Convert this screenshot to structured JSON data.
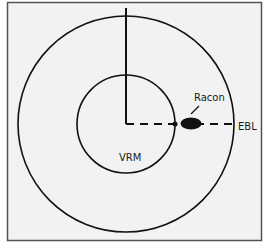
{
  "diagram": {
    "labels": {
      "racon": "Racon",
      "vrm": "VRM",
      "ebl": "EBL"
    },
    "colors": {
      "background": "#f2f2f2",
      "frame": "#555555",
      "ink": "#111111"
    },
    "elements": [
      {
        "id": "outer-range-ring",
        "type": "circle"
      },
      {
        "id": "vrm-ring",
        "type": "circle",
        "label": "VRM"
      },
      {
        "id": "heading-line",
        "type": "line"
      },
      {
        "id": "ebl-line",
        "type": "dashed-line",
        "label": "EBL"
      },
      {
        "id": "racon-echo",
        "type": "ellipse",
        "label": "Racon"
      }
    ]
  }
}
